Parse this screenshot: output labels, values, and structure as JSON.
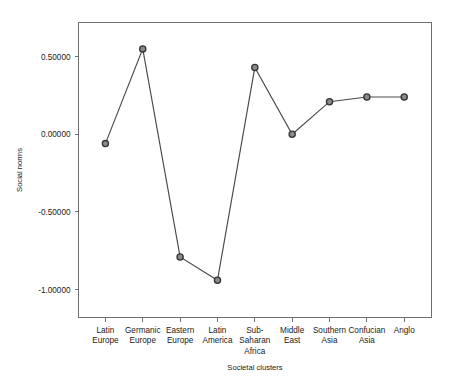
{
  "chart_data": {
    "type": "line",
    "title": "",
    "xlabel": "Societal clusters",
    "ylabel": "Social norms",
    "categories": [
      "Latin\nEurope",
      "Germanic\nEurope",
      "Eastern\nEurope",
      "Latin\nAmerica",
      "Sub-\nSaharan\nAfrica",
      "Middle\nEast",
      "Southern\nAsia",
      "Confucian\nAsia",
      "Anglo"
    ],
    "category_lines": [
      [
        "Latin",
        "Europe"
      ],
      [
        "Germanic",
        "Europe"
      ],
      [
        "Eastern",
        "Europe"
      ],
      [
        "Latin",
        "America"
      ],
      [
        "Sub-",
        "Saharan",
        "Africa"
      ],
      [
        "Middle",
        "East"
      ],
      [
        "Southern",
        "Asia"
      ],
      [
        "Confucian",
        "Asia"
      ],
      [
        "Anglo"
      ]
    ],
    "values": [
      -0.06,
      0.55,
      -0.79,
      -0.94,
      0.43,
      0.0,
      0.21,
      0.24,
      0.24
    ],
    "ylim": [
      -1.18,
      0.72
    ],
    "yticks": [
      0.5,
      0.0,
      -0.5,
      -1.0
    ],
    "ytick_labels": [
      "0.50000",
      "0.00000",
      "-0.50000",
      "-1.00000"
    ],
    "grid": false,
    "legend": "none",
    "marker": "open-circle",
    "line_color": "#4a4a4a",
    "marker_fill": "#8a8a8a",
    "marker_stroke": "#333333",
    "frame_color": "#6e6e6e",
    "background": "#ffffff"
  },
  "axis": {
    "y_title": "Social norms",
    "x_title": "Societal clusters"
  }
}
